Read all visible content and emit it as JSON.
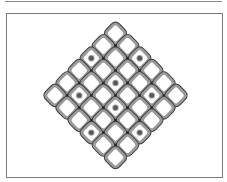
{
  "figure": {
    "type": "diamond-lattice",
    "grid": {
      "rows": 6,
      "cols": 6
    },
    "geometry": {
      "apex_top": [
        115.5,
        21
      ],
      "step_down_right": [
        12.1,
        12.4
      ],
      "step_down_left": [
        -12.1,
        12.4
      ]
    },
    "marked_cells": [
      {
        "i": 0,
        "j": 2
      },
      {
        "i": 2,
        "j": 0
      },
      {
        "i": 2,
        "j": 2
      },
      {
        "i": 1,
        "j": 4
      },
      {
        "i": 4,
        "j": 1
      },
      {
        "i": 3,
        "j": 3
      },
      {
        "i": 3,
        "j": 5
      },
      {
        "i": 5,
        "j": 3
      }
    ],
    "colors": {
      "tile_fill": "#ffffff",
      "bar": "#9a9a9a",
      "bar_outline": "#3a3a3a",
      "joint": "#202020",
      "dot": "#555555",
      "dot_ring": "#9a9a9a",
      "frame": "#7a7a7a"
    }
  }
}
